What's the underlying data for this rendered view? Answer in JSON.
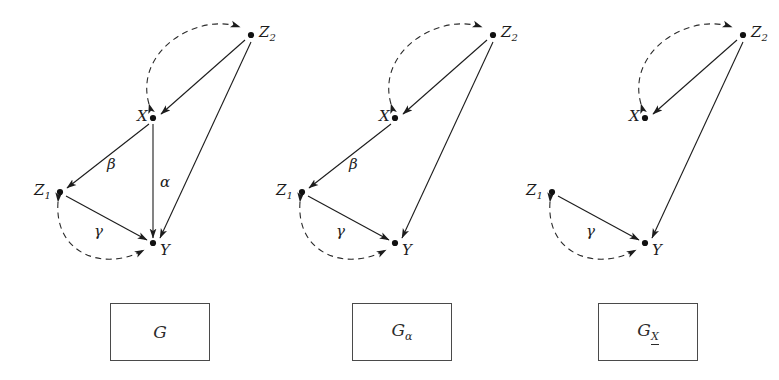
{
  "figure": {
    "stroke_color": "#1c1c1c",
    "dashed_color": "#2b2b2b",
    "box_border_color": "#4a4a4a"
  },
  "panels": [
    {
      "id": "panel-g",
      "caption": "G",
      "caption_sub": "",
      "caption_sub_underlined": false,
      "nodes": [
        {
          "name": "X",
          "label": "X",
          "sub": "",
          "cx": 145,
          "cy": 118,
          "label_dx": -16,
          "label_dy": -9
        },
        {
          "name": "Z2",
          "label": "Z",
          "sub": "2",
          "cx": 243,
          "cy": 35,
          "label_dx": 8,
          "label_dy": -10
        },
        {
          "name": "Z1",
          "label": "Z",
          "sub": "1",
          "cx": 52,
          "cy": 192,
          "label_dx": -26,
          "label_dy": -9
        },
        {
          "name": "Y",
          "label": "Y",
          "sub": "",
          "cx": 145,
          "cy": 243,
          "label_dx": 7,
          "label_dy": 0
        }
      ],
      "edges": [
        {
          "name": "edge-z2-to-x",
          "from": "Z2",
          "to": "X",
          "style": "solid",
          "label": ""
        },
        {
          "name": "edge-x-to-z2-bidirected",
          "from": "X",
          "to": "Z2",
          "style": "dashed",
          "label": ""
        },
        {
          "name": "edge-x-to-z1",
          "from": "X",
          "to": "Z1",
          "style": "solid",
          "label": "β"
        },
        {
          "name": "edge-x-to-y",
          "from": "X",
          "to": "Y",
          "style": "solid",
          "label": "α"
        },
        {
          "name": "edge-z2-to-y",
          "from": "Z2",
          "to": "Y",
          "style": "solid",
          "label": ""
        },
        {
          "name": "edge-z1-to-y",
          "from": "Z1",
          "to": "Y",
          "style": "solid",
          "label": "γ"
        },
        {
          "name": "edge-z1-to-y-bidirected",
          "from": "Z1",
          "to": "Y",
          "style": "dashed",
          "label": ""
        }
      ],
      "edge_labels": [
        {
          "name": "edge-label-beta",
          "text": "β",
          "x": 99,
          "y": 157
        },
        {
          "name": "edge-label-alpha",
          "text": "α",
          "x": 152,
          "y": 175
        },
        {
          "name": "edge-label-gamma",
          "text": "γ",
          "x": 86,
          "y": 224
        }
      ]
    },
    {
      "id": "panel-g-alpha",
      "caption": "G",
      "caption_sub": "α",
      "caption_sub_underlined": false,
      "nodes": [
        {
          "name": "X",
          "label": "X",
          "sub": "",
          "cx": 145,
          "cy": 118,
          "label_dx": -16,
          "label_dy": -9
        },
        {
          "name": "Z2",
          "label": "Z",
          "sub": "2",
          "cx": 243,
          "cy": 35,
          "label_dx": 8,
          "label_dy": -10
        },
        {
          "name": "Z1",
          "label": "Z",
          "sub": "1",
          "cx": 52,
          "cy": 192,
          "label_dx": -26,
          "label_dy": -9
        },
        {
          "name": "Y",
          "label": "Y",
          "sub": "",
          "cx": 145,
          "cy": 243,
          "label_dx": 7,
          "label_dy": 0
        }
      ],
      "edges": [
        {
          "name": "edge-z2-to-x",
          "from": "Z2",
          "to": "X",
          "style": "solid",
          "label": ""
        },
        {
          "name": "edge-x-to-z2-bidirected",
          "from": "X",
          "to": "Z2",
          "style": "dashed",
          "label": ""
        },
        {
          "name": "edge-x-to-z1",
          "from": "X",
          "to": "Z1",
          "style": "solid",
          "label": "β"
        },
        {
          "name": "edge-z2-to-y",
          "from": "Z2",
          "to": "Y",
          "style": "solid",
          "label": ""
        },
        {
          "name": "edge-z1-to-y",
          "from": "Z1",
          "to": "Y",
          "style": "solid",
          "label": "γ"
        },
        {
          "name": "edge-z1-to-y-bidirected",
          "from": "Z1",
          "to": "Y",
          "style": "dashed",
          "label": ""
        }
      ],
      "edge_labels": [
        {
          "name": "edge-label-beta",
          "text": "β",
          "x": 99,
          "y": 157
        },
        {
          "name": "edge-label-gamma",
          "text": "γ",
          "x": 86,
          "y": 224
        }
      ]
    },
    {
      "id": "panel-g-x-underbar",
      "caption": "G",
      "caption_sub": "X",
      "caption_sub_underlined": true,
      "nodes": [
        {
          "name": "X",
          "label": "X",
          "sub": "",
          "cx": 145,
          "cy": 118,
          "label_dx": -16,
          "label_dy": -9
        },
        {
          "name": "Z2",
          "label": "Z",
          "sub": "2",
          "cx": 243,
          "cy": 35,
          "label_dx": 8,
          "label_dy": -10
        },
        {
          "name": "Z1",
          "label": "Z",
          "sub": "1",
          "cx": 52,
          "cy": 192,
          "label_dx": -26,
          "label_dy": -9
        },
        {
          "name": "Y",
          "label": "Y",
          "sub": "",
          "cx": 145,
          "cy": 243,
          "label_dx": 7,
          "label_dy": 0
        }
      ],
      "edges": [
        {
          "name": "edge-z2-to-x",
          "from": "Z2",
          "to": "X",
          "style": "solid",
          "label": ""
        },
        {
          "name": "edge-x-to-z2-bidirected",
          "from": "X",
          "to": "Z2",
          "style": "dashed",
          "label": ""
        },
        {
          "name": "edge-z2-to-y",
          "from": "Z2",
          "to": "Y",
          "style": "solid",
          "label": ""
        },
        {
          "name": "edge-z1-to-y",
          "from": "Z1",
          "to": "Y",
          "style": "solid",
          "label": "γ"
        },
        {
          "name": "edge-z1-to-y-bidirected",
          "from": "Z1",
          "to": "Y",
          "style": "dashed",
          "label": ""
        }
      ],
      "edge_labels": [
        {
          "name": "edge-label-gamma",
          "text": "γ",
          "x": 86,
          "y": 224
        }
      ]
    }
  ],
  "panel_offsets": [
    8,
    250,
    500
  ],
  "caption_boxes": [
    {
      "name": "caption-box-g",
      "x": 110,
      "y": 303,
      "w": 100,
      "h": 58
    },
    {
      "name": "caption-box-g-alpha",
      "x": 352,
      "y": 303,
      "w": 100,
      "h": 58
    },
    {
      "name": "caption-box-g-x",
      "x": 598,
      "y": 303,
      "w": 100,
      "h": 58
    }
  ]
}
